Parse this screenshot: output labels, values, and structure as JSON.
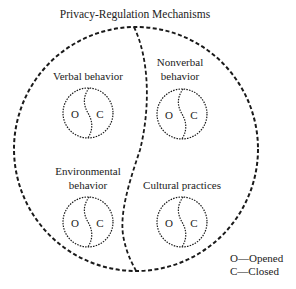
{
  "title": "Privacy-Regulation Mechanisms",
  "quadrants": [
    {
      "label_lines": [
        "Verbal behavior"
      ],
      "open": "O",
      "closed": "C"
    },
    {
      "label_lines": [
        "Nonverbal",
        "behavior"
      ],
      "open": "O",
      "closed": "C"
    },
    {
      "label_lines": [
        "Environmental",
        "behavior"
      ],
      "open": "O",
      "closed": "C"
    },
    {
      "label_lines": [
        "Cultural practices"
      ],
      "open": "O",
      "closed": "C"
    }
  ],
  "legend": {
    "opened": "O—Opened",
    "closed": "C—Closed"
  },
  "colors": {
    "stroke": "#1a1a1a",
    "text": "#222222",
    "background": "#ffffff"
  }
}
